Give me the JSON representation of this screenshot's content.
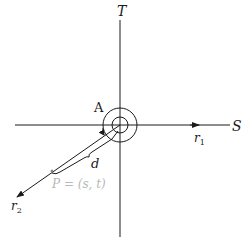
{
  "diagram": {
    "axes": {
      "horizontal_label": "S",
      "vertical_label": "T"
    },
    "rays": {
      "r1_label": "r",
      "r1_sub": "1",
      "r2_label": "r",
      "r2_sub": "2"
    },
    "angle_label": "A",
    "distance_label": "d",
    "point_label": "P = (s, t)",
    "colors": {
      "stroke": "#1a1a1a",
      "point_label": "#b8b8b8"
    }
  }
}
